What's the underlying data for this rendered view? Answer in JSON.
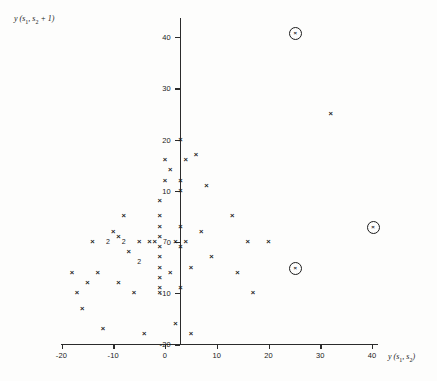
{
  "chart_data": {
    "type": "scatter",
    "title": "",
    "xlabel": "y (s1, s2)",
    "ylabel": "y (s1, s2 + 1)",
    "xlabel_parts": {
      "prefix": "y (s",
      "sub1": "1",
      "mid": ", s",
      "sub2": "2",
      "suffix": ")"
    },
    "ylabel_parts": {
      "prefix": "y (s",
      "sub1": "1",
      "mid": ", s",
      "sub2": "2",
      "suffix": " + 1)"
    },
    "xlim": [
      -20,
      44
    ],
    "ylim": [
      -20,
      44
    ],
    "xticks": [
      -20,
      -10,
      0,
      10,
      20,
      30,
      40
    ],
    "yticks": [
      -20,
      -10,
      0,
      10,
      20,
      30,
      40
    ],
    "xticklabels": [
      "-20",
      "-10",
      "0",
      "10",
      "20",
      "30",
      "40"
    ],
    "yticklabels": [
      "-20",
      "-10",
      "0",
      "10",
      "20",
      "30",
      "40"
    ],
    "grid": false,
    "legend": "none",
    "marker": "x",
    "marker_color": "#1c1c1c",
    "outlier_marker": "circled-x",
    "points": [
      {
        "x": -18,
        "y": -6
      },
      {
        "x": -17,
        "y": -10
      },
      {
        "x": -16,
        "y": -13
      },
      {
        "x": -15,
        "y": -8
      },
      {
        "x": -14,
        "y": 0
      },
      {
        "x": -13,
        "y": -6
      },
      {
        "x": -12,
        "y": -17
      },
      {
        "x": -11,
        "y": 0,
        "count": 2,
        "label": "2"
      },
      {
        "x": -10,
        "y": 2
      },
      {
        "x": -9,
        "y": 1
      },
      {
        "x": -9,
        "y": -8
      },
      {
        "x": -8,
        "y": 5
      },
      {
        "x": -8,
        "y": 0,
        "count": 2,
        "label": "2"
      },
      {
        "x": -7,
        "y": -2
      },
      {
        "x": -6,
        "y": -10
      },
      {
        "x": -5,
        "y": -4,
        "count": 2,
        "label": "2"
      },
      {
        "x": -5,
        "y": 0
      },
      {
        "x": -4,
        "y": -18
      },
      {
        "x": -3,
        "y": 0
      },
      {
        "x": -2,
        "y": 0
      },
      {
        "x": -1,
        "y": 8
      },
      {
        "x": -1,
        "y": 5
      },
      {
        "x": -1,
        "y": 3
      },
      {
        "x": -1,
        "y": 1
      },
      {
        "x": -1,
        "y": -1
      },
      {
        "x": -1,
        "y": -3
      },
      {
        "x": -1,
        "y": -5
      },
      {
        "x": -1,
        "y": -7
      },
      {
        "x": -1,
        "y": -9
      },
      {
        "x": -1,
        "y": -10
      },
      {
        "x": 0,
        "y": 16
      },
      {
        "x": 0,
        "y": 12
      },
      {
        "x": 0,
        "y": 0,
        "count": 7,
        "label": "7"
      },
      {
        "x": 1,
        "y": 14
      },
      {
        "x": 1,
        "y": -6
      },
      {
        "x": 2,
        "y": 0
      },
      {
        "x": 2,
        "y": -16
      },
      {
        "x": 3,
        "y": 20
      },
      {
        "x": 3,
        "y": 12
      },
      {
        "x": 3,
        "y": 10
      },
      {
        "x": 3,
        "y": 3
      },
      {
        "x": 3,
        "y": -1
      },
      {
        "x": 3,
        "y": -9
      },
      {
        "x": 4,
        "y": 16
      },
      {
        "x": 4,
        "y": 0
      },
      {
        "x": 5,
        "y": -5
      },
      {
        "x": 5,
        "y": -18
      },
      {
        "x": 6,
        "y": 17
      },
      {
        "x": 7,
        "y": 2
      },
      {
        "x": 8,
        "y": 11
      },
      {
        "x": 9,
        "y": -3
      },
      {
        "x": 13,
        "y": 5
      },
      {
        "x": 14,
        "y": -6
      },
      {
        "x": 16,
        "y": 0
      },
      {
        "x": 17,
        "y": -10
      },
      {
        "x": 20,
        "y": 0
      },
      {
        "x": 32,
        "y": 25
      }
    ],
    "outliers": [
      {
        "x": 25,
        "y": 41
      },
      {
        "x": 40,
        "y": 3
      },
      {
        "x": 25,
        "y": -5
      }
    ]
  },
  "axis": {
    "x_origin_px": 165,
    "px_per_unit_x": 5.175,
    "y_zero_px": 242,
    "px_per_unit_y": 5.12
  }
}
